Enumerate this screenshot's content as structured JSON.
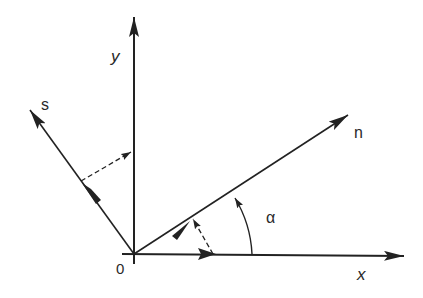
{
  "diagram": {
    "title": "",
    "colors": {
      "stroke": "#222222",
      "background": "#ffffff"
    },
    "origin": {
      "label": "0"
    },
    "axes": [
      {
        "id": "x",
        "label": "x"
      },
      {
        "id": "y",
        "label": "y"
      }
    ],
    "vectors": [
      {
        "id": "n",
        "label": "n"
      },
      {
        "id": "s",
        "label": "s"
      }
    ],
    "angle": {
      "label": "α",
      "between": [
        "x",
        "n"
      ]
    },
    "projections": [
      {
        "from": "s",
        "to": "y",
        "style": "dashed"
      },
      {
        "from": "x",
        "to": "n",
        "style": "dashed"
      }
    ]
  }
}
